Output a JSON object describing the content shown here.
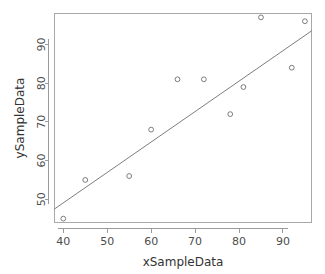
{
  "chart_data": {
    "type": "scatter",
    "title": "",
    "subtitle": "",
    "xlabel": "xSampleData",
    "ylabel": "ySampleData",
    "xlim": [
      38,
      96.5
    ],
    "ylim": [
      44,
      98
    ],
    "xticks": [
      40,
      50,
      60,
      70,
      80,
      90
    ],
    "yticks": [
      50,
      60,
      70,
      80,
      90
    ],
    "xtick_labels": [
      "40",
      "50",
      "60",
      "70",
      "80",
      "90"
    ],
    "ytick_labels": [
      "50",
      "60",
      "70",
      "80",
      "90"
    ],
    "grid": false,
    "legend": null,
    "point_marker": "open-circle",
    "x": [
      40,
      45,
      55,
      60,
      66,
      72,
      78,
      81,
      85,
      92,
      95
    ],
    "y": [
      45,
      55,
      56,
      68,
      81,
      81,
      72,
      79,
      97,
      84,
      96
    ],
    "points": [
      {
        "x": 40,
        "y": 45
      },
      {
        "x": 45,
        "y": 55
      },
      {
        "x": 55,
        "y": 56
      },
      {
        "x": 60,
        "y": 68
      },
      {
        "x": 66,
        "y": 81
      },
      {
        "x": 72,
        "y": 81
      },
      {
        "x": 78,
        "y": 72
      },
      {
        "x": 81,
        "y": 79
      },
      {
        "x": 85,
        "y": 97
      },
      {
        "x": 92,
        "y": 84
      },
      {
        "x": 95,
        "y": 96
      }
    ],
    "series": [
      {
        "name": "sample",
        "type": "scatter",
        "x": [
          40,
          45,
          55,
          60,
          66,
          72,
          78,
          81,
          85,
          92,
          95
        ],
        "values": [
          45,
          55,
          56,
          68,
          81,
          81,
          72,
          79,
          97,
          84,
          96
        ]
      },
      {
        "name": "regression-line",
        "type": "line",
        "x": [
          38,
          96.5
        ],
        "values": [
          47.5,
          93.5
        ]
      }
    ],
    "regression_line": {
      "x_start": 38,
      "y_start": 47.5,
      "x_end": 96.5,
      "y_end": 93.5,
      "slope": 0.786,
      "intercept": 17.6
    },
    "colors": {
      "point_stroke": "#6e6e6e",
      "line_stroke": "#6e6e6e",
      "axis": "#9a9a9a",
      "frame": "#a8a8a8",
      "text": "#333333",
      "background": "#ffffff"
    }
  }
}
